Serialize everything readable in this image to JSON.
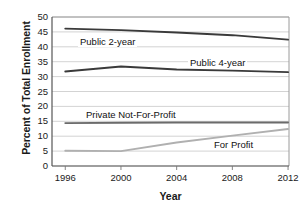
{
  "chart_data": {
    "type": "line",
    "title": "",
    "xlabel": "Year",
    "ylabel": "Percent of Total Enrollment",
    "x": [
      1996,
      2000,
      2004,
      2008,
      2012
    ],
    "xtick_labels": [
      "1996",
      "2000",
      "2004",
      "2008",
      "2012"
    ],
    "ytick_labels": [
      "0",
      "5",
      "10",
      "15",
      "20",
      "25",
      "30",
      "35",
      "40",
      "45",
      "50"
    ],
    "ytick_values": [
      0,
      5,
      10,
      15,
      20,
      25,
      30,
      35,
      40,
      45,
      50
    ],
    "xlim": [
      1995,
      2013
    ],
    "ylim": [
      0,
      50
    ],
    "grid": "horizontal",
    "legend": "inline-labels",
    "series": [
      {
        "name": "Public 2-year",
        "values": [
          46.1,
          45.6,
          44.8,
          43.9,
          42.4
        ],
        "color": "#3a3a3a",
        "label_x": 78,
        "label_y": 36
      },
      {
        "name": "Public 4-year",
        "values": [
          31.7,
          33.4,
          32.4,
          32.0,
          31.5
        ],
        "color": "#3a3a3a",
        "label_x": 188,
        "label_y": 57
      },
      {
        "name": "Private Not-For-Profit",
        "values": [
          14.4,
          14.5,
          14.6,
          14.6,
          14.6
        ],
        "color": "#6b6b6b",
        "label_x": 84,
        "label_y": 109
      },
      {
        "name": "For Profit",
        "values": [
          5.1,
          5.0,
          7.9,
          10.2,
          12.4
        ],
        "color": "#b0b0b0",
        "label_x": 212,
        "label_y": 139
      }
    ]
  }
}
